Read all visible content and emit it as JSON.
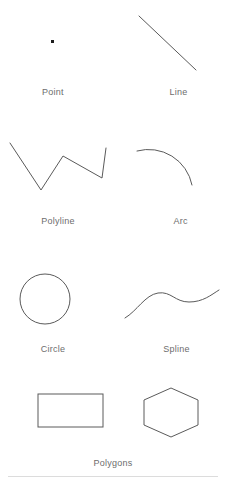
{
  "panel": {
    "title": "Geometry Primitives",
    "background_color": "#ffffff",
    "stroke_color": "#5a5a5a",
    "label_color": "#6d6d6d",
    "divider_color": "#dcdcdc"
  },
  "groups": [
    {
      "caption": "Point",
      "shape": "point",
      "icon": "point-icon"
    },
    {
      "caption": "Line",
      "shape": "line",
      "icon": "line-icon"
    },
    {
      "caption": "Polyline",
      "shape": "polyline",
      "icon": "polyline-icon"
    },
    {
      "caption": "Arc",
      "shape": "arc",
      "icon": "arc-icon"
    },
    {
      "caption": "Circle",
      "shape": "circle",
      "icon": "circle-icon"
    },
    {
      "caption": "Spline",
      "shape": "spline",
      "icon": "spline-icon"
    },
    {
      "caption": "Polygons",
      "shape": "polygons",
      "icon": "polygons-icon"
    }
  ],
  "labels": {
    "point": "Point",
    "line": "Line",
    "polyline": "Polyline",
    "arc": "Arc",
    "circle": "Circle",
    "spline": "Spline",
    "polygons": "Polygons"
  }
}
